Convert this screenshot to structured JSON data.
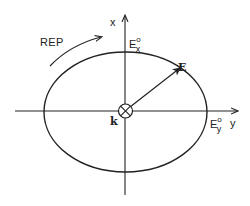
{
  "diagram": {
    "type": "polarization-ellipse",
    "labels": {
      "x_axis": "x",
      "y_axis": "y",
      "rotation": "REP",
      "field_vector": "E",
      "wave_vector": "k",
      "ex_amplitude": {
        "base": "E",
        "sup": "o",
        "sub": "x"
      },
      "ey_amplitude": {
        "base": "E",
        "sup": "o",
        "sub": "y"
      }
    },
    "colors": {
      "stroke": "#222222",
      "background": "#ffffff"
    }
  }
}
